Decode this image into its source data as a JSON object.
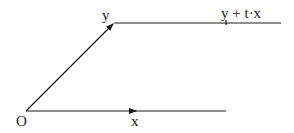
{
  "diagram": {
    "labels": {
      "origin": "O",
      "x": "x",
      "y": "y",
      "y_plus_tx": "y + t·x"
    },
    "colors": {
      "line": "#1a1a1a",
      "background": "#ffffff"
    }
  }
}
